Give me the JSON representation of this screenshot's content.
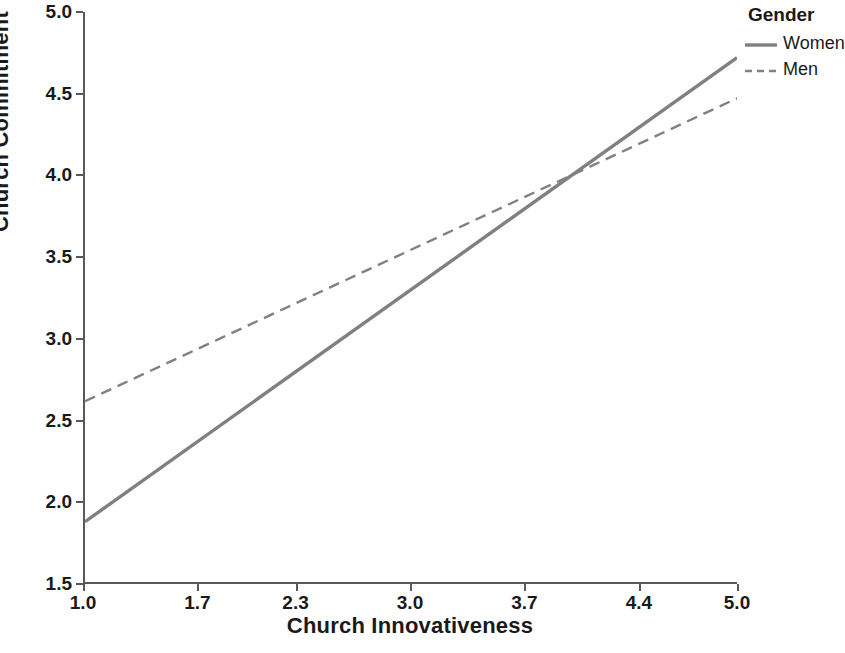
{
  "chart_data": {
    "type": "line",
    "title": "",
    "xlabel": "Church Innovativeness",
    "ylabel": "Church Commitment",
    "xlim": [
      1.0,
      5.0
    ],
    "ylim": [
      1.5,
      5.0
    ],
    "xticks": [
      "1.0",
      "1.7",
      "2.3",
      "3.0",
      "3.7",
      "4.4",
      "5.0"
    ],
    "xtick_values": [
      1.0,
      1.7,
      2.3,
      3.0,
      3.7,
      4.4,
      5.0
    ],
    "yticks": [
      "1.5",
      "2.0",
      "2.5",
      "3.0",
      "3.5",
      "4.0",
      "4.5",
      "5.0"
    ],
    "ytick_values": [
      1.5,
      2.0,
      2.5,
      3.0,
      3.5,
      4.0,
      4.5,
      5.0
    ],
    "grid": false,
    "legend_position": "top-right",
    "legend_title": "Gender",
    "series": [
      {
        "name": "Women",
        "style": "solid",
        "color": "#808080",
        "x": [
          1.0,
          5.0
        ],
        "values": [
          1.87,
          4.72
        ]
      },
      {
        "name": "Men",
        "style": "dashed",
        "color": "#808080",
        "x": [
          1.0,
          5.0
        ],
        "values": [
          2.61,
          4.47
        ]
      }
    ],
    "annotations": [
      {
        "text": "lines cross",
        "x": 4.05,
        "y": 4.05
      }
    ],
    "axis_color": "#595959",
    "background": "#ffffff"
  }
}
